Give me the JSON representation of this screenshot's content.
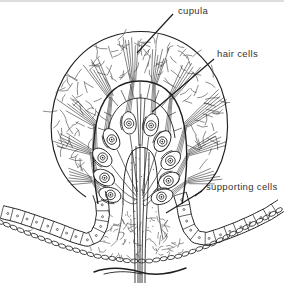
{
  "labels": {
    "cupula": "cupula",
    "hair_cells": "hair cells",
    "supporting_cells": "supporting cells"
  },
  "colors": {
    "background": "#ffffff",
    "ink": "#1f1f1f",
    "texture_ink": "#4f4f4f",
    "text": "#333333",
    "scan_edge": "#a9aeae"
  }
}
